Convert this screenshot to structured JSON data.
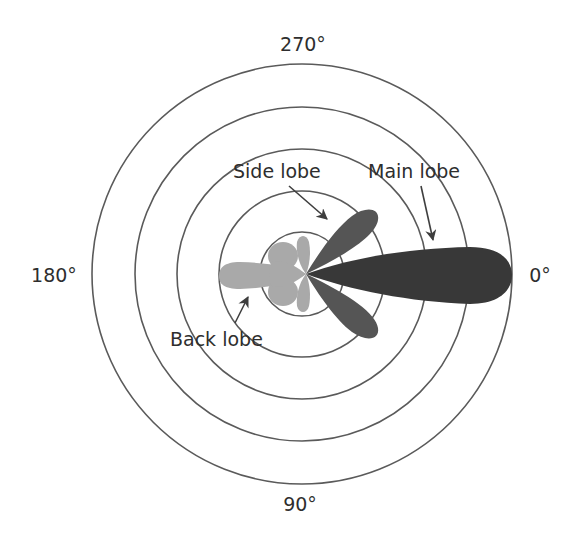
{
  "diagram": {
    "type": "antenna radiation pattern (polar plot)",
    "center": [
      302,
      274
    ],
    "ring_radii": [
      42,
      83,
      125,
      167,
      210
    ],
    "colors": {
      "background": "#ffffff",
      "rings": "#5a5a5a",
      "main_lobe": "#383838",
      "side_lobe": "#555555",
      "back_lobe": "#a9a9a9",
      "text": "#2e2e2e"
    },
    "angle_labels": {
      "top": "270°",
      "left": "180°",
      "right": "0°",
      "bottom": "90°"
    },
    "annotations": {
      "main_lobe": "Main lobe",
      "side_lobe": "Side lobe",
      "back_lobe": "Back lobe"
    }
  }
}
